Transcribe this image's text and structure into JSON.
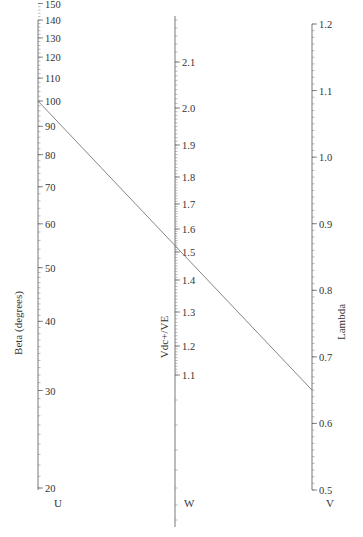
{
  "chart_data": {
    "type": "nomogram",
    "title": "",
    "axes": [
      {
        "id": "U",
        "label": "Beta (degrees)",
        "letter": "U",
        "scale": "log",
        "tick_labels": [
          20,
          30,
          40,
          50,
          60,
          70,
          80,
          90,
          100,
          110,
          120,
          130,
          140,
          150
        ],
        "range": [
          20,
          150
        ]
      },
      {
        "id": "W",
        "label": "Vdc+/VE",
        "letter": "W",
        "scale": "nonlinear",
        "tick_labels": [
          1.1,
          1.2,
          1.3,
          1.4,
          1.5,
          1.6,
          1.7,
          1.8,
          1.9,
          2.0,
          2.1
        ]
      },
      {
        "id": "V",
        "label": "Lambda",
        "letter": "V",
        "scale": "linear",
        "tick_labels": [
          0.5,
          0.6,
          0.7,
          0.8,
          0.9,
          1.0,
          1.1,
          1.2
        ],
        "range": [
          0.5,
          1.2
        ]
      }
    ],
    "isopleth": {
      "U": 100,
      "W": 1.5,
      "V": 0.65
    },
    "grid": false,
    "legend": "none"
  }
}
